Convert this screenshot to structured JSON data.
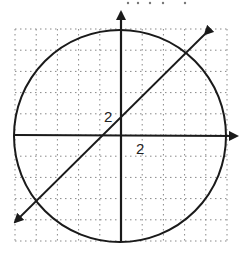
{
  "diagram": {
    "type": "coordinate-graph",
    "grid": {
      "style": "dotted",
      "cells_x": 10,
      "cells_y": 10,
      "color": "#888888"
    },
    "axes": {
      "x_arrow": true,
      "y_arrow": true,
      "color": "#1a1a1a"
    },
    "labels": {
      "y_tick": "2",
      "x_tick": "2"
    },
    "circle": {
      "center": [
        0,
        0
      ],
      "radius_units": 10
    },
    "line": {
      "slope": 1,
      "arrows": "both"
    },
    "top_text_fragment": "· ·  · ·  ·"
  }
}
